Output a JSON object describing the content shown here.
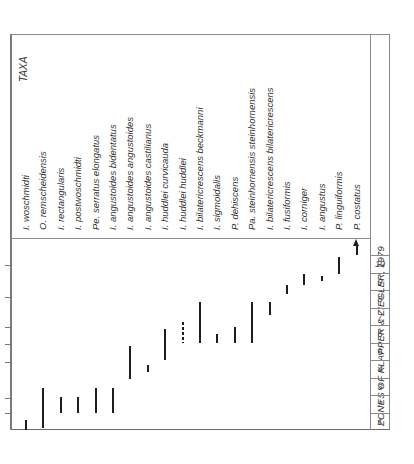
{
  "chart_data": {
    "type": "range",
    "orientation": "rotated-90",
    "title": "ZONES OF KLAPPER & ZIEGLER, 1979",
    "taxa_header": "TAXA",
    "zones": [
      "1",
      "2",
      "3",
      "4",
      "5",
      "6",
      "7",
      "8",
      "9",
      "10"
    ],
    "series": [
      {
        "name": "I. woschmidti",
        "from": 1.0,
        "to": 1.6,
        "style": "solid"
      },
      {
        "name": "O. remscheidensis",
        "from": 1.1,
        "to": 3.4,
        "style": "solid"
      },
      {
        "name": "I. rectangularis",
        "from": 2.0,
        "to": 2.9,
        "style": "solid"
      },
      {
        "name": "I. postwoschmidti",
        "from": 2.0,
        "to": 2.9,
        "style": "solid"
      },
      {
        "name": "Pe. serratus elongatus",
        "from": 2.0,
        "to": 3.4,
        "style": "solid"
      },
      {
        "name": "I. angustoides bidentatus",
        "from": 2.0,
        "to": 3.4,
        "style": "solid"
      },
      {
        "name": "I. angustoides angustoides",
        "from": 3.9,
        "to": 5.8,
        "style": "solid"
      },
      {
        "name": "I. angustoides castilianus",
        "from": 4.3,
        "to": 4.7,
        "style": "solid"
      },
      {
        "name": "I. huddlei curvicauda",
        "from": 5.0,
        "to": 6.8,
        "style": "solid"
      },
      {
        "name": "I. huddlei huddlei",
        "from": 6.0,
        "to": 7.2,
        "style": "dashed"
      },
      {
        "name": "I. bilatericrescens beckmanni",
        "from": 6.0,
        "to": 8.3,
        "style": "solid"
      },
      {
        "name": "I. sigmoidalis",
        "from": 6.0,
        "to": 6.5,
        "style": "solid"
      },
      {
        "name": "P. dehiscens",
        "from": 6.0,
        "to": 6.9,
        "style": "solid"
      },
      {
        "name": "Pa. steinhornensis steinhornensis",
        "from": 6.0,
        "to": 8.3,
        "style": "solid"
      },
      {
        "name": "I. bilatericrescens bilatericrescens",
        "from": 7.6,
        "to": 8.3,
        "style": "solid"
      },
      {
        "name": "I. fusiformis",
        "from": 8.8,
        "to": 9.3,
        "style": "solid"
      },
      {
        "name": "I. corniger",
        "from": 9.3,
        "to": 9.9,
        "style": "solid"
      },
      {
        "name": "I. angustus",
        "from": 9.5,
        "to": 9.8,
        "style": "solid"
      },
      {
        "name": "P. linguiformis",
        "from": 9.9,
        "to": 10.9,
        "style": "solid"
      },
      {
        "name": "P. costatus",
        "from": 11.0,
        "to": 11.9,
        "style": "arrow-up"
      }
    ],
    "xlabel": "TAXA",
    "ylabel": "ZONES OF KLAPPER & ZIEGLER, 1979",
    "ylim": [
      1,
      10
    ],
    "grid": false,
    "legend": "none"
  }
}
